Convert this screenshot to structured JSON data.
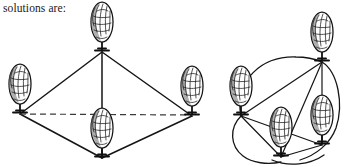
{
  "caption": {
    "text": "solutions are:"
  },
  "colors": {
    "background": "#ffffff",
    "ink": "#151515",
    "dashed_line": "#3a3a3a",
    "foliage_fill": "#fdfdfd",
    "shading": "#6e6e6e"
  },
  "figure": {
    "left_graph": {
      "name": "diamond-graph",
      "node_count": 4,
      "nodes": [
        {
          "id": "top",
          "label": "tree-top",
          "x": 102,
          "y": 52
        },
        {
          "id": "left",
          "label": "tree-left",
          "x": 20,
          "y": 114
        },
        {
          "id": "right",
          "label": "tree-right",
          "x": 192,
          "y": 116
        },
        {
          "id": "bottom",
          "label": "tree-bottom",
          "x": 102,
          "y": 158
        }
      ],
      "edges": [
        {
          "from": "top",
          "to": "left",
          "style": "solid"
        },
        {
          "from": "top",
          "to": "right",
          "style": "solid"
        },
        {
          "from": "left",
          "to": "bottom",
          "style": "solid"
        },
        {
          "from": "right",
          "to": "bottom",
          "style": "solid"
        },
        {
          "from": "top",
          "to": "bottom",
          "style": "solid"
        },
        {
          "from": "left",
          "to": "right",
          "style": "dashed"
        }
      ]
    },
    "right_graph": {
      "name": "circular-graph",
      "node_count": 4,
      "nodes": [
        {
          "id": "topright",
          "label": "tree-top-right",
          "x": 322,
          "y": 62
        },
        {
          "id": "left",
          "label": "tree-left",
          "x": 241,
          "y": 116
        },
        {
          "id": "bottom",
          "label": "tree-bottom",
          "x": 281,
          "y": 157
        },
        {
          "id": "right",
          "label": "tree-right",
          "x": 322,
          "y": 145
        }
      ],
      "edges": [
        {
          "from": "left",
          "to": "topright",
          "style": "arc"
        },
        {
          "from": "topright",
          "to": "right",
          "style": "arc"
        },
        {
          "from": "left",
          "to": "bottom",
          "style": "arc"
        },
        {
          "from": "bottom",
          "to": "right",
          "style": "arc"
        },
        {
          "from": "left",
          "to": "topright",
          "style": "solid"
        },
        {
          "from": "left",
          "to": "bottom",
          "style": "solid"
        },
        {
          "from": "left",
          "to": "right",
          "style": "solid"
        },
        {
          "from": "topright",
          "to": "bottom",
          "style": "solid"
        },
        {
          "from": "topright",
          "to": "right",
          "style": "solid"
        },
        {
          "from": "bottom",
          "to": "right",
          "style": "solid"
        }
      ]
    }
  }
}
